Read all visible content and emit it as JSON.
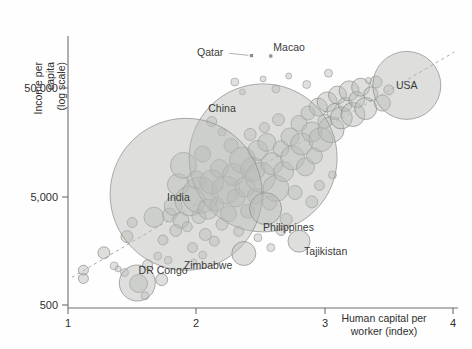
{
  "chart_data": {
    "type": "scatter",
    "title": "",
    "xlabel": "Human capital per worker (index)",
    "ylabel": "Income per capita (log scale)",
    "xlim": [
      1,
      4
    ],
    "ylim": [
      500,
      150000
    ],
    "yscale": "log",
    "grid": false,
    "legend": null,
    "xticks": [
      1,
      2,
      3,
      4
    ],
    "xtick_labels": [
      "1",
      "2",
      "3",
      "4"
    ],
    "yticks": [
      500,
      5000,
      50000
    ],
    "ytick_labels": [
      "500",
      "5,000",
      "50,000"
    ],
    "marker": "bubble (area ~ population)",
    "trendline": {
      "present": true,
      "style": "dashed",
      "x": [
        1.03,
        4.01
      ],
      "y": [
        900,
        110000
      ]
    },
    "labeled_points": [
      {
        "name": "Qatar",
        "x": 2.43,
        "y": 102000,
        "label_x": 2.21,
        "label_y": 108000,
        "size": 3
      },
      {
        "name": "Macao",
        "x": 2.58,
        "y": 101000,
        "label_x": 2.6,
        "label_y": 122000,
        "size": 3
      },
      {
        "name": "USA",
        "x": 3.64,
        "y": 54000,
        "label_x": 3.64,
        "label_y": 54000,
        "size": 34
      },
      {
        "name": "China",
        "x": 2.52,
        "y": 11500,
        "label_x": 2.2,
        "label_y": 33000,
        "size": 74
      },
      {
        "name": "India",
        "x": 1.92,
        "y": 5300,
        "label_x": 1.86,
        "label_y": 5000,
        "size": 76
      },
      {
        "name": "Philippines",
        "x": 2.54,
        "y": 3900,
        "label_x": 2.52,
        "label_y": 2600,
        "size": 16
      },
      {
        "name": "Tajikistan",
        "x": 2.8,
        "y": 1950,
        "label_x": 2.84,
        "label_y": 1550,
        "size": 11
      },
      {
        "name": "Zimbabwe",
        "x": 2.37,
        "y": 1500,
        "label_x": 2.28,
        "label_y": 1150,
        "size": 12
      },
      {
        "name": "DR Congo",
        "x": 1.54,
        "y": 800,
        "label_x": 1.55,
        "label_y": 1050,
        "size": 18
      }
    ],
    "points": [
      {
        "x": 1.12,
        "y": 1050,
        "r": 5
      },
      {
        "x": 1.12,
        "y": 880,
        "r": 5
      },
      {
        "x": 1.28,
        "y": 1520,
        "r": 6
      },
      {
        "x": 1.36,
        "y": 1150,
        "r": 4
      },
      {
        "x": 1.39,
        "y": 1080,
        "r": 3
      },
      {
        "x": 1.44,
        "y": 1000,
        "r": 4
      },
      {
        "x": 1.46,
        "y": 2150,
        "r": 6
      },
      {
        "x": 1.5,
        "y": 2900,
        "r": 5
      },
      {
        "x": 1.55,
        "y": 790,
        "r": 9
      },
      {
        "x": 1.6,
        "y": 610,
        "r": 4
      },
      {
        "x": 1.62,
        "y": 1180,
        "r": 5
      },
      {
        "x": 1.67,
        "y": 3250,
        "r": 10
      },
      {
        "x": 1.7,
        "y": 1420,
        "r": 4
      },
      {
        "x": 1.73,
        "y": 860,
        "r": 6
      },
      {
        "x": 1.74,
        "y": 2000,
        "r": 5
      },
      {
        "x": 1.78,
        "y": 1300,
        "r": 4
      },
      {
        "x": 1.79,
        "y": 3400,
        "r": 7
      },
      {
        "x": 1.82,
        "y": 4100,
        "r": 9
      },
      {
        "x": 1.84,
        "y": 2450,
        "r": 6
      },
      {
        "x": 1.86,
        "y": 6500,
        "r": 11
      },
      {
        "x": 1.88,
        "y": 3050,
        "r": 8
      },
      {
        "x": 1.9,
        "y": 9800,
        "r": 13
      },
      {
        "x": 1.93,
        "y": 2650,
        "r": 5
      },
      {
        "x": 1.95,
        "y": 4600,
        "r": 15
      },
      {
        "x": 1.97,
        "y": 1700,
        "r": 5
      },
      {
        "x": 2.0,
        "y": 7200,
        "r": 9
      },
      {
        "x": 2.02,
        "y": 3300,
        "r": 7
      },
      {
        "x": 2.03,
        "y": 5200,
        "r": 18
      },
      {
        "x": 2.05,
        "y": 12500,
        "r": 8
      },
      {
        "x": 2.07,
        "y": 2250,
        "r": 6
      },
      {
        "x": 2.09,
        "y": 3850,
        "r": 10
      },
      {
        "x": 2.12,
        "y": 6900,
        "r": 12
      },
      {
        "x": 2.14,
        "y": 1950,
        "r": 5
      },
      {
        "x": 2.16,
        "y": 4300,
        "r": 7
      },
      {
        "x": 2.18,
        "y": 9200,
        "r": 9
      },
      {
        "x": 2.2,
        "y": 2800,
        "r": 6
      },
      {
        "x": 2.23,
        "y": 5800,
        "r": 14
      },
      {
        "x": 2.25,
        "y": 3500,
        "r": 8
      },
      {
        "x": 2.27,
        "y": 15000,
        "r": 7
      },
      {
        "x": 2.29,
        "y": 8100,
        "r": 11
      },
      {
        "x": 2.31,
        "y": 4900,
        "r": 9
      },
      {
        "x": 2.33,
        "y": 2400,
        "r": 5
      },
      {
        "x": 2.36,
        "y": 11000,
        "r": 13
      },
      {
        "x": 2.38,
        "y": 6200,
        "r": 10
      },
      {
        "x": 2.4,
        "y": 3700,
        "r": 7
      },
      {
        "x": 2.42,
        "y": 19000,
        "r": 6
      },
      {
        "x": 2.44,
        "y": 9000,
        "r": 12
      },
      {
        "x": 2.46,
        "y": 5100,
        "r": 8
      },
      {
        "x": 2.48,
        "y": 13500,
        "r": 10
      },
      {
        "x": 2.5,
        "y": 7600,
        "r": 15
      },
      {
        "x": 2.53,
        "y": 22000,
        "r": 5
      },
      {
        "x": 2.55,
        "y": 16000,
        "r": 9
      },
      {
        "x": 2.57,
        "y": 4400,
        "r": 7
      },
      {
        "x": 2.59,
        "y": 10200,
        "r": 11
      },
      {
        "x": 2.62,
        "y": 6000,
        "r": 13
      },
      {
        "x": 2.64,
        "y": 26000,
        "r": 6
      },
      {
        "x": 2.66,
        "y": 14000,
        "r": 8
      },
      {
        "x": 2.68,
        "y": 8600,
        "r": 10
      },
      {
        "x": 2.7,
        "y": 3100,
        "r": 6
      },
      {
        "x": 2.73,
        "y": 18000,
        "r": 9
      },
      {
        "x": 2.75,
        "y": 11500,
        "r": 12
      },
      {
        "x": 2.77,
        "y": 5500,
        "r": 7
      },
      {
        "x": 2.8,
        "y": 24000,
        "r": 8
      },
      {
        "x": 2.82,
        "y": 15500,
        "r": 11
      },
      {
        "x": 2.85,
        "y": 9500,
        "r": 9
      },
      {
        "x": 2.87,
        "y": 30000,
        "r": 7
      },
      {
        "x": 2.9,
        "y": 20000,
        "r": 10
      },
      {
        "x": 2.92,
        "y": 12000,
        "r": 8
      },
      {
        "x": 2.95,
        "y": 34000,
        "r": 9
      },
      {
        "x": 2.97,
        "y": 17000,
        "r": 12
      },
      {
        "x": 3.0,
        "y": 25000,
        "r": 7
      },
      {
        "x": 3.02,
        "y": 38000,
        "r": 10
      },
      {
        "x": 3.05,
        "y": 21000,
        "r": 13
      },
      {
        "x": 3.08,
        "y": 31000,
        "r": 8
      },
      {
        "x": 3.1,
        "y": 44000,
        "r": 9
      },
      {
        "x": 3.13,
        "y": 27000,
        "r": 11
      },
      {
        "x": 3.16,
        "y": 36000,
        "r": 7
      },
      {
        "x": 3.19,
        "y": 48000,
        "r": 10
      },
      {
        "x": 3.22,
        "y": 29000,
        "r": 12
      },
      {
        "x": 3.25,
        "y": 40000,
        "r": 8
      },
      {
        "x": 3.28,
        "y": 52000,
        "r": 9
      },
      {
        "x": 3.32,
        "y": 33000,
        "r": 11
      },
      {
        "x": 3.36,
        "y": 45000,
        "r": 7
      },
      {
        "x": 3.4,
        "y": 58000,
        "r": 6
      },
      {
        "x": 3.45,
        "y": 37000,
        "r": 8
      },
      {
        "x": 3.5,
        "y": 49000,
        "r": 5
      },
      {
        "x": 2.3,
        "y": 58000,
        "r": 4
      },
      {
        "x": 2.36,
        "y": 47000,
        "r": 3
      },
      {
        "x": 2.52,
        "y": 62000,
        "r": 3
      },
      {
        "x": 2.62,
        "y": 50000,
        "r": 4
      },
      {
        "x": 2.72,
        "y": 66000,
        "r": 3
      },
      {
        "x": 2.86,
        "y": 55000,
        "r": 4
      },
      {
        "x": 3.03,
        "y": 70000,
        "r": 4
      },
      {
        "x": 3.34,
        "y": 60000,
        "r": 3
      },
      {
        "x": 2.12,
        "y": 25000,
        "r": 5
      },
      {
        "x": 2.2,
        "y": 20000,
        "r": 4
      },
      {
        "x": 2.58,
        "y": 1700,
        "r": 4
      },
      {
        "x": 2.66,
        "y": 2450,
        "r": 5
      },
      {
        "x": 2.48,
        "y": 2100,
        "r": 4
      },
      {
        "x": 2.9,
        "y": 4500,
        "r": 6
      },
      {
        "x": 2.96,
        "y": 6400,
        "r": 5
      },
      {
        "x": 3.06,
        "y": 8000,
        "r": 4
      },
      {
        "x": 2.05,
        "y": 1450,
        "r": 4
      },
      {
        "x": 1.98,
        "y": 1250,
        "r": 3
      }
    ]
  },
  "axes": {
    "y_title_line1": "Income per",
    "y_title_line2": "capita",
    "y_title_line3": "(log scale)",
    "x_title_line1": "Human capital per",
    "x_title_line2": "worker (index)"
  },
  "colors": {
    "bubble_fill": "#b9bbb8",
    "bubble_stroke": "#8e918d",
    "axis": "#6d6d6d",
    "text": "#2e2e2e",
    "trend": "#a9aba8",
    "background": "#fefefe"
  }
}
